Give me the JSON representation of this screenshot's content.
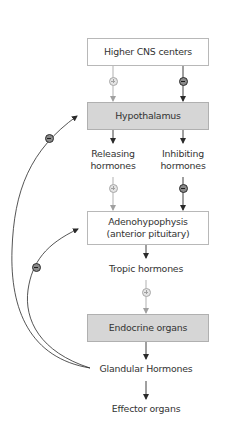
{
  "diagram": {
    "nodes": {
      "higher_cns": "Higher CNS centers",
      "hypothalamus": "Hypothalamus",
      "releasing": [
        "Releasing",
        "hormones"
      ],
      "inhibiting": [
        "Inhibiting",
        "hormones"
      ],
      "adenohypophysis": [
        "Adenohypophysis",
        "(anterior pituitary)"
      ],
      "tropic": "Tropic hormones",
      "endocrine": "Endocrine organs",
      "glandular": "Glandular Hormones",
      "effector": "Effector organs"
    },
    "signs": {
      "plus": "+",
      "minus": "−"
    },
    "edges": [
      {
        "from": "Higher CNS centers",
        "to": "Hypothalamus",
        "sign": "+",
        "color": "#a0a0a0"
      },
      {
        "from": "Higher CNS centers",
        "to": "Hypothalamus",
        "sign": "−",
        "color": "#2a2a2a"
      },
      {
        "from": "Hypothalamus",
        "to": "Releasing hormones",
        "sign": "",
        "color": "#2a2a2a"
      },
      {
        "from": "Hypothalamus",
        "to": "Inhibiting hormones",
        "sign": "",
        "color": "#2a2a2a"
      },
      {
        "from": "Releasing hormones",
        "to": "Adenohypophysis",
        "sign": "+",
        "color": "#a0a0a0"
      },
      {
        "from": "Inhibiting hormones",
        "to": "Adenohypophysis",
        "sign": "−",
        "color": "#2a2a2a"
      },
      {
        "from": "Adenohypophysis",
        "to": "Tropic hormones",
        "sign": "",
        "color": "#2a2a2a"
      },
      {
        "from": "Tropic hormones",
        "to": "Endocrine organs",
        "sign": "+",
        "color": "#a0a0a0"
      },
      {
        "from": "Endocrine organs",
        "to": "Glandular Hormones",
        "sign": "",
        "color": "#2a2a2a"
      },
      {
        "from": "Glandular Hormones",
        "to": "Effector organs",
        "sign": "",
        "color": "#2a2a2a"
      },
      {
        "from": "Glandular Hormones",
        "to": "Hypothalamus",
        "sign": "−",
        "color": "#2a2a2a",
        "type": "feedback"
      },
      {
        "from": "Glandular Hormones",
        "to": "Adenohypophysis",
        "sign": "−",
        "color": "#2a2a2a",
        "type": "feedback"
      }
    ],
    "colors": {
      "box_gray_fill": "#d6d6d6",
      "box_border": "#b8b8b8",
      "stimulatory": "#a0a0a0",
      "inhibitory": "#2a2a2a",
      "text": "#333333"
    }
  }
}
